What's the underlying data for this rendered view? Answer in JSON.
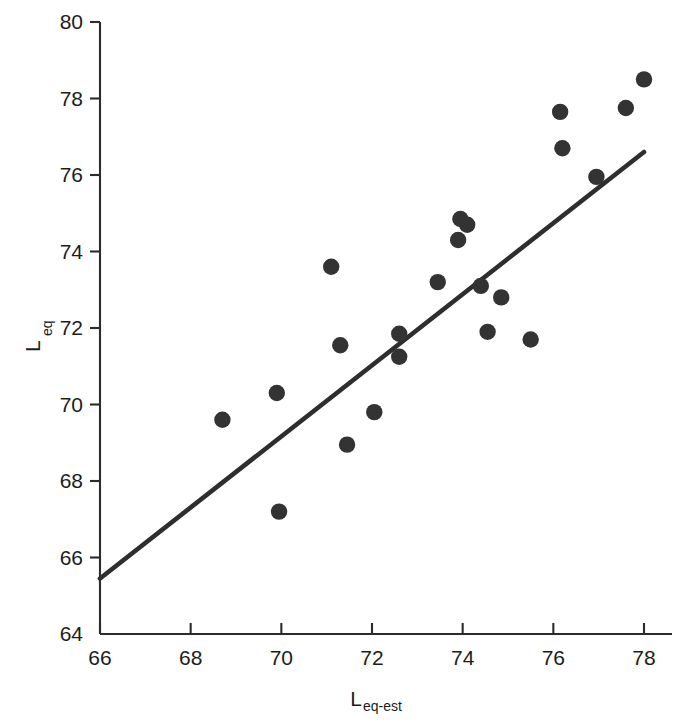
{
  "chart_data": {
    "type": "scatter",
    "title": "",
    "xlabel": "L_eq-est",
    "xlabel_main": "L",
    "xlabel_sub": "eq-est",
    "ylabel": "L_eq",
    "ylabel_main": "L",
    "ylabel_sub": "eq",
    "xlim": [
      66,
      78
    ],
    "ylim": [
      64,
      80
    ],
    "xticks": [
      66,
      68,
      70,
      72,
      74,
      76,
      78
    ],
    "yticks": [
      64,
      66,
      68,
      70,
      72,
      74,
      76,
      78,
      80
    ],
    "xtick_labels": [
      "66",
      "68",
      "70",
      "72",
      "74",
      "76",
      "78"
    ],
    "ytick_labels": [
      "64",
      "66",
      "68",
      "70",
      "72",
      "74",
      "76",
      "78",
      "80"
    ],
    "grid": false,
    "legend": false,
    "marker": "filled-circle",
    "marker_color": "#333333",
    "point_count": 24,
    "points": [
      {
        "x": 68.7,
        "y": 69.6
      },
      {
        "x": 69.9,
        "y": 70.3
      },
      {
        "x": 69.95,
        "y": 67.2
      },
      {
        "x": 71.1,
        "y": 73.6
      },
      {
        "x": 71.3,
        "y": 71.55
      },
      {
        "x": 71.45,
        "y": 68.95
      },
      {
        "x": 72.05,
        "y": 69.8
      },
      {
        "x": 72.6,
        "y": 71.85
      },
      {
        "x": 72.6,
        "y": 71.25
      },
      {
        "x": 73.45,
        "y": 73.2
      },
      {
        "x": 73.95,
        "y": 74.85
      },
      {
        "x": 74.1,
        "y": 74.7
      },
      {
        "x": 73.9,
        "y": 74.3
      },
      {
        "x": 74.4,
        "y": 73.1
      },
      {
        "x": 74.55,
        "y": 71.9
      },
      {
        "x": 74.85,
        "y": 72.8
      },
      {
        "x": 75.5,
        "y": 71.7
      },
      {
        "x": 76.15,
        "y": 77.65
      },
      {
        "x": 76.2,
        "y": 76.7
      },
      {
        "x": 76.95,
        "y": 75.95
      },
      {
        "x": 77.6,
        "y": 77.75
      },
      {
        "x": 78.0,
        "y": 78.5
      }
    ],
    "fit_line": {
      "type": "linear-regression",
      "x_start": 66.0,
      "y_start": 65.45,
      "x_end": 78.0,
      "y_end": 76.6
    }
  }
}
